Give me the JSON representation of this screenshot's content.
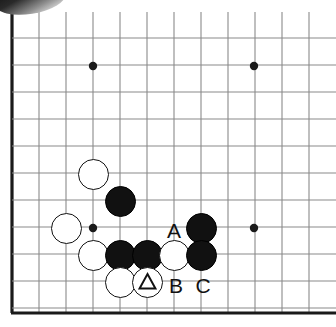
{
  "figure": {
    "kind": "go-board-diagram",
    "background_color": "#ffffff",
    "line_color": "#8a8a8a",
    "edge_line_color": "#1a1a1a",
    "black_stone_color": "#111111",
    "white_stone_color": "#ffffff",
    "label_color": "#111111"
  },
  "board": {
    "columns": 12,
    "rows": 11,
    "spacing": 27,
    "origin_x": 12,
    "origin_y": 38,
    "bottom_edge_y": 313,
    "left_edge_thick": true,
    "bottom_edge_thick": true,
    "star_points": [
      {
        "name": "star-point-top-left",
        "x": 93,
        "y": 66
      },
      {
        "name": "star-point-top-right",
        "x": 254,
        "y": 66
      },
      {
        "name": "star-point-bottom-left",
        "x": 93,
        "y": 228
      },
      {
        "name": "star-point-bottom-right",
        "x": 254,
        "y": 228
      }
    ]
  },
  "stones": [
    {
      "id": "white-stone-1",
      "color": "white",
      "x": 93,
      "y": 174,
      "mark": ""
    },
    {
      "id": "black-stone-1",
      "color": "black",
      "x": 120,
      "y": 201,
      "mark": ""
    },
    {
      "id": "white-stone-2",
      "color": "white",
      "x": 66,
      "y": 228,
      "mark": ""
    },
    {
      "id": "black-stone-2",
      "color": "black",
      "x": 201,
      "y": 228,
      "mark": ""
    },
    {
      "id": "white-stone-3",
      "color": "white",
      "x": 93,
      "y": 255,
      "mark": ""
    },
    {
      "id": "black-stone-3",
      "color": "black",
      "x": 120,
      "y": 255,
      "mark": ""
    },
    {
      "id": "black-stone-4",
      "color": "black",
      "x": 147,
      "y": 255,
      "mark": ""
    },
    {
      "id": "white-stone-4",
      "color": "white",
      "x": 174,
      "y": 255,
      "mark": ""
    },
    {
      "id": "black-stone-5",
      "color": "black",
      "x": 201,
      "y": 255,
      "mark": ""
    },
    {
      "id": "white-stone-5",
      "color": "white",
      "x": 120,
      "y": 282,
      "mark": ""
    },
    {
      "id": "white-stone-triangle",
      "color": "white",
      "x": 147,
      "y": 282,
      "mark": "triangle"
    }
  ],
  "labels": [
    {
      "id": "label-a",
      "text": "A",
      "x": 174,
      "y": 230
    },
    {
      "id": "label-b",
      "text": "B",
      "x": 176,
      "y": 285
    },
    {
      "id": "label-c",
      "text": "C",
      "x": 203,
      "y": 285
    }
  ]
}
